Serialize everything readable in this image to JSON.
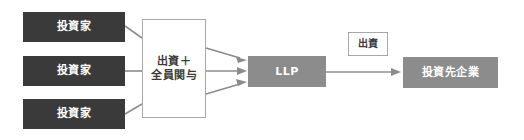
{
  "diagram": {
    "type": "flow-diagram",
    "background_color": "#ffffff",
    "palette": {
      "dark_box": "#3a3a3a",
      "gray_box": "#8c8c8c",
      "outline_border": "#a8a8a8",
      "connector": "#8c8c8c",
      "box_text": "#ffffff",
      "outline_text": "#3a3a3a"
    },
    "nodes": {
      "investor_1": {
        "label": "投資家",
        "style": "dark"
      },
      "investor_2": {
        "label": "投資家",
        "style": "dark"
      },
      "investor_3": {
        "label": "投資家",
        "style": "dark"
      },
      "contribution_participation": {
        "label": "出資＋\n全員関与",
        "style": "outline"
      },
      "llp": {
        "label": "LLP",
        "style": "gray"
      },
      "investment_label": {
        "label": "出資",
        "style": "outline-small"
      },
      "portfolio_company": {
        "label": "投資先企業",
        "style": "gray"
      }
    },
    "edges": [
      {
        "from": "investor_1",
        "to": "contribution_participation",
        "arrowhead": false
      },
      {
        "from": "investor_2",
        "to": "contribution_participation",
        "arrowhead": false
      },
      {
        "from": "investor_3",
        "to": "contribution_participation",
        "arrowhead": false
      },
      {
        "from": "contribution_participation",
        "to": "llp",
        "arrowhead": true
      },
      {
        "from": "contribution_participation",
        "to": "llp",
        "arrowhead": true
      },
      {
        "from": "contribution_participation",
        "to": "llp",
        "arrowhead": true
      },
      {
        "from": "llp",
        "to": "portfolio_company",
        "arrowhead": true
      }
    ]
  }
}
